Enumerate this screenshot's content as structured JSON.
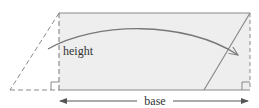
{
  "diagram": {
    "labels": {
      "height": "height",
      "base": "base"
    },
    "colors": {
      "fill": "#eeeeee",
      "stroke": "#8a8a8a",
      "text": "#333333"
    },
    "shapes": {
      "rectangle": "parallelogram-transformed-to-rectangle",
      "cut_triangle": "dashed-left-triangle",
      "moved_triangle_edge": "slanted-right-line",
      "arrow": "curved-move-arrow",
      "right_angle_marks": 2
    }
  }
}
